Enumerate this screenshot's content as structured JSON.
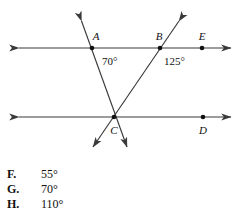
{
  "figure": {
    "line_color": "#3a3a3a",
    "label_color": "#111111",
    "points": [
      {
        "name": "A",
        "label": "A",
        "x": 92,
        "y": 48,
        "label_x": 96,
        "label_y": 40
      },
      {
        "name": "B",
        "label": "B",
        "x": 160,
        "y": 48,
        "label_x": 157,
        "label_y": 40
      },
      {
        "name": "E",
        "label": "E",
        "x": 202,
        "y": 48,
        "label_x": 199,
        "label_y": 40
      },
      {
        "name": "C",
        "label": "C",
        "x": 114,
        "y": 117,
        "label_x": 110,
        "label_y": 133
      },
      {
        "name": "D",
        "label": "D",
        "x": 203,
        "y": 117,
        "label_x": 199,
        "label_y": 133
      }
    ],
    "angles": [
      {
        "name": "angle-at-A",
        "value": "70°",
        "x": 102,
        "y": 64
      },
      {
        "name": "angle-at-B",
        "value": "125°",
        "x": 164,
        "y": 64
      }
    ],
    "lines": [
      {
        "name": "top-parallel-line",
        "x1": 14,
        "y1": 48,
        "x2": 236,
        "y2": 48
      },
      {
        "name": "bottom-parallel-line",
        "x1": 14,
        "y1": 117,
        "x2": 236,
        "y2": 117
      },
      {
        "name": "transversal-through-A-C",
        "x1": 79,
        "y1": 16,
        "x2": 129,
        "y2": 152
      },
      {
        "name": "transversal-through-B-C",
        "x1": 182,
        "y1": 16,
        "x2": 90,
        "y2": 152
      }
    ]
  },
  "choices": [
    {
      "key": "F.",
      "value": "55°"
    },
    {
      "key": "G.",
      "value": "70°"
    },
    {
      "key": "H.",
      "value": "110°"
    }
  ]
}
